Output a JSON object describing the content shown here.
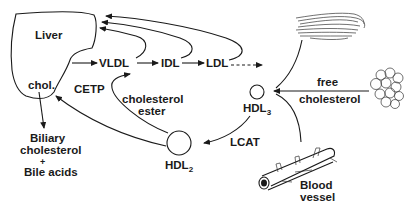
{
  "diagram": {
    "nodes": {
      "liver": "Liver",
      "chol": "chol.",
      "vldl": "VLDL",
      "idl": "IDL",
      "ldl": "LDL",
      "cetp": "CETP",
      "ce_line1": "cholesterol",
      "ce_line2": "ester",
      "hdl3_base": "HDL",
      "hdl3_sub": "3",
      "hdl2_base": "HDL",
      "hdl2_sub": "2",
      "lcat": "LCAT",
      "free_line1": "free",
      "free_line2": "cholesterol",
      "biliary_line1": "Biliary",
      "biliary_line2": "cholesterol",
      "biliary_plus": "+",
      "biliary_line3": "Bile acids",
      "vessel_line1": "Blood",
      "vessel_line2": "vessel"
    },
    "edges": [
      {
        "from": "Liver",
        "to": "VLDL"
      },
      {
        "from": "VLDL",
        "to": "IDL"
      },
      {
        "from": "IDL",
        "to": "LDL"
      },
      {
        "from": "LDL",
        "to": "peripheral",
        "style": "dashed"
      },
      {
        "from": "VLDL",
        "to": "Liver"
      },
      {
        "from": "IDL",
        "to": "Liver"
      },
      {
        "from": "LDL",
        "to": "Liver"
      },
      {
        "from": "muscle",
        "to": "HDL3"
      },
      {
        "from": "adipose",
        "to": "HDL3",
        "label": "free cholesterol"
      },
      {
        "from": "blood vessel",
        "to": "HDL3"
      },
      {
        "from": "HDL3",
        "to": "HDL2",
        "label": "LCAT"
      },
      {
        "from": "HDL2",
        "to": "VLDL",
        "label": "cholesterol ester (CETP)"
      },
      {
        "from": "HDL2",
        "to": "Liver"
      },
      {
        "from": "chol.",
        "to": "Biliary cholesterol + Bile acids"
      }
    ],
    "icons": [
      "liver-shape",
      "muscle-fiber-icon",
      "adipose-cells-icon",
      "blood-vessel-icon"
    ]
  }
}
